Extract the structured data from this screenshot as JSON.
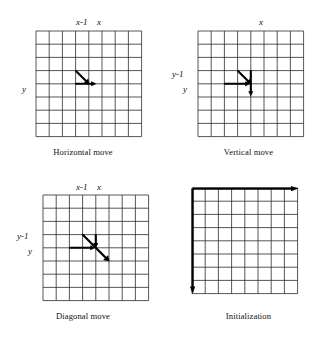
{
  "figure": {
    "type": "diagram",
    "grid": {
      "rows": 8,
      "cols": 8,
      "cell_px": 13.2,
      "line_color": "#2b2b2b"
    },
    "panels": [
      {
        "id": "horizontal-move",
        "caption": "Horizontal move",
        "col_labels": [
          {
            "text": "x-1",
            "col_index": 4
          },
          {
            "text": "x",
            "col_index": 5
          }
        ],
        "row_labels": [
          {
            "text": "y",
            "row_index": 4
          }
        ],
        "arrows": [
          {
            "name": "diagonal-pointer",
            "kind": "diagonal",
            "dir": "down-right",
            "head": "end"
          },
          {
            "name": "horizontal-pointer",
            "kind": "horizontal",
            "dir": "right",
            "head": "end"
          }
        ]
      },
      {
        "id": "vertical-move",
        "caption": "Vertical move",
        "col_labels": [
          {
            "text": "x",
            "col_index": 5
          }
        ],
        "row_labels": [
          {
            "text": "y-1",
            "row_index": 3
          },
          {
            "text": "y",
            "row_index": 4
          }
        ],
        "arrows": [
          {
            "name": "diagonal-pointer",
            "kind": "diagonal",
            "dir": "down-right",
            "head": "end"
          },
          {
            "name": "horizontal-pointer",
            "kind": "horizontal",
            "dir": "right",
            "head": "end"
          },
          {
            "name": "vertical-pointer",
            "kind": "vertical",
            "dir": "down",
            "head": "end"
          }
        ]
      },
      {
        "id": "diagonal-move",
        "caption": "Diagonal move",
        "col_labels": [
          {
            "text": "x-1",
            "col_index": 4
          },
          {
            "text": "x",
            "col_index": 5
          }
        ],
        "row_labels": [
          {
            "text": "y-1",
            "row_index": 3
          },
          {
            "text": "y",
            "row_index": 4
          }
        ],
        "arrows": [
          {
            "name": "long-diagonal-pointer",
            "kind": "diagonal-long",
            "dir": "down-right",
            "head": "end"
          },
          {
            "name": "horizontal-pointer",
            "kind": "horizontal",
            "dir": "right",
            "head": "end"
          },
          {
            "name": "vertical-pointer",
            "kind": "vertical",
            "dir": "down",
            "head": "end"
          }
        ]
      },
      {
        "id": "initialization",
        "caption": "Initialization",
        "col_labels": [],
        "row_labels": [],
        "arrows": [
          {
            "name": "top-row-arrow",
            "kind": "edge-horizontal",
            "dir": "right",
            "head": "end"
          },
          {
            "name": "left-column-arrow",
            "kind": "edge-vertical",
            "dir": "down",
            "head": "end"
          }
        ]
      }
    ]
  }
}
